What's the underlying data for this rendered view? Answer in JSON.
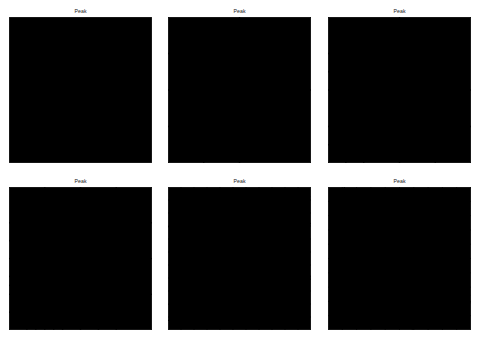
{
  "figure": {
    "kind": "adaptive-mesh-refinement-grid",
    "rows": 2,
    "cols": 3,
    "background_color": "#ffffff",
    "line_color": "#3c3c3c",
    "frame_color": "#555555",
    "node_color": "#000000",
    "panel_count": 6
  },
  "panels": [
    {
      "id": "panel-1",
      "title": "Peak",
      "position": {
        "row": 0,
        "col": 0,
        "x": 9,
        "y": 17,
        "width": 143,
        "height": 146
      },
      "refinement_level": 0,
      "description": "Coarse initial triangulation: unit square split by both diagonals and midlines, with an extra cross in the lower-left quadrant",
      "node_count": 11
    },
    {
      "id": "panel-2",
      "title": "Peak",
      "position": {
        "row": 0,
        "col": 1,
        "x": 168,
        "y": 17,
        "width": 143,
        "height": 146
      },
      "refinement_level": 1,
      "description": "First refinement: additional subdivision in the lower-left and upper-left quadrants",
      "node_count": 15
    },
    {
      "id": "panel-3",
      "title": "Peak",
      "position": {
        "row": 0,
        "col": 2,
        "x": 328,
        "y": 17,
        "width": 143,
        "height": 146
      },
      "refinement_level": 2,
      "description": "Second refinement: nested sub-squares with crossed diagonals clustering toward the lower-left peak",
      "node_count": 21
    },
    {
      "id": "panel-4",
      "title": "Peak",
      "position": {
        "row": 1,
        "col": 0,
        "x": 9,
        "y": 187,
        "width": 143,
        "height": 143
      },
      "refinement_level": 5,
      "description": "Mid-stage refinement: dense graded triangulation filling the left half, coarse elements remaining in the upper right",
      "node_count": 190
    },
    {
      "id": "panel-5",
      "title": "Peak",
      "position": {
        "row": 1,
        "col": 1,
        "x": 168,
        "y": 187,
        "width": 143,
        "height": 143
      },
      "refinement_level": 8,
      "description": "Advanced refinement: a saturated circular cluster of elements around the peak at roughly (0.3, 0.3), unstructured triangles elsewhere",
      "node_count": 900,
      "peak_center": {
        "x": 0.3,
        "y": 0.3
      },
      "peak_radius": 0.18
    },
    {
      "id": "panel-6",
      "title": "Peak",
      "position": {
        "row": 1,
        "col": 2,
        "x": 328,
        "y": 187,
        "width": 143,
        "height": 143
      },
      "refinement_level": 10,
      "description": "Final refinement: the largest fully saturated circular blob of elements centred on the peak, graded outward to coarse unstructured triangles",
      "node_count": 2400,
      "peak_center": {
        "x": 0.3,
        "y": 0.33
      },
      "peak_radius": 0.24
    }
  ]
}
